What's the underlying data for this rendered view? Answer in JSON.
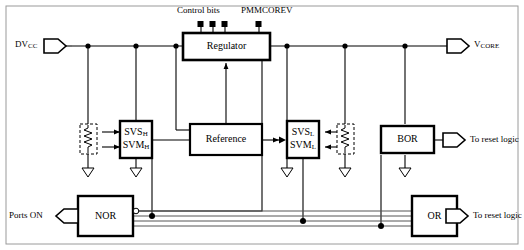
{
  "diagram": {
    "style": {
      "line_color": "#000000",
      "block_fill": "#ffffff",
      "bus_color": "#555555",
      "background": "#ffffff"
    },
    "blocks": [
      {
        "id": "regulator",
        "label": "Regulator"
      },
      {
        "id": "reference",
        "label": "Reference"
      },
      {
        "id": "svs_high",
        "label_line1": "SVS",
        "label_line1_sub": "H",
        "label_line2": "SVM",
        "label_line2_sub": "H"
      },
      {
        "id": "svs_low",
        "label_line1": "SVS",
        "label_line1_sub": "L",
        "label_line2": "SVM",
        "label_line2_sub": "L"
      },
      {
        "id": "bor",
        "label": "BOR"
      },
      {
        "id": "nor_gate",
        "label": "NOR"
      },
      {
        "id": "or_gate",
        "label": "OR"
      }
    ],
    "signals": {
      "control_bits": "Control bits",
      "pmmcorev": "PMMCOREV",
      "dvcc_main": "DV",
      "dvcc_sub": "CC",
      "vcore_main": "V",
      "vcore_sub": "CORE",
      "ports_on": "Ports ON",
      "to_reset_logic_bor": "To reset logic",
      "to_reset_logic_or": "To reset logic"
    },
    "terminals": {
      "control_bits_count": 3,
      "pmmcorev_count": 1
    },
    "ground_symbols": 5,
    "bus_lines": 4,
    "dividers": [
      {
        "id": "divider-high",
        "type": "resistive-divider"
      },
      {
        "id": "divider-low",
        "type": "resistive-divider"
      }
    ]
  }
}
